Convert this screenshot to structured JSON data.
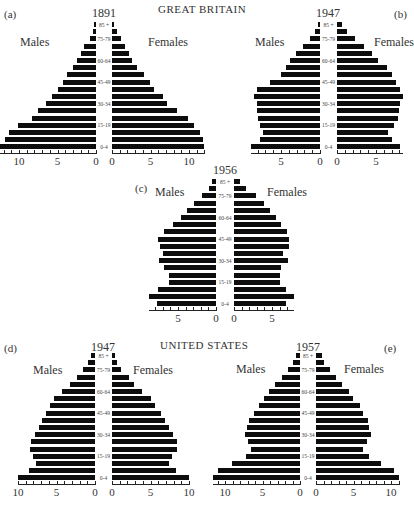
{
  "figure": {
    "titles": {
      "top": "GREAT BRITAIN",
      "bottom": "UNITED STATES"
    },
    "sex_labels": {
      "male": "Males",
      "female": "Females"
    },
    "age_groups": [
      "0-4",
      "5-9",
      "10-14",
      "15-19",
      "20-24",
      "25-29",
      "30-34",
      "35-39",
      "40-44",
      "45-49",
      "50-54",
      "55-59",
      "60-64",
      "65-69",
      "70-74",
      "75-79",
      "80-84",
      "85+"
    ],
    "labeled_ages": [
      "0-4",
      "15-19",
      "30-34",
      "45-49",
      "60-64",
      "75-79",
      "85 +"
    ]
  },
  "chart_data": [
    {
      "type": "bar",
      "subtype": "population-pyramid",
      "panel": "(a)",
      "region": "GREAT BRITAIN",
      "title": "1891",
      "categories": [
        "0-4",
        "5-9",
        "10-14",
        "15-19",
        "20-24",
        "25-29",
        "30-34",
        "35-39",
        "40-44",
        "45-49",
        "50-54",
        "55-59",
        "60-64",
        "65-69",
        "70-74",
        "75-79",
        "80-84",
        "85+"
      ],
      "series": [
        {
          "name": "Males",
          "values": [
            12.5,
            11.8,
            11.3,
            10.1,
            8.3,
            7.5,
            6.5,
            5.7,
            5.0,
            4.3,
            3.8,
            3.0,
            2.5,
            2.0,
            1.5,
            0.8,
            0.4,
            0.3
          ]
        },
        {
          "name": "Females",
          "values": [
            12.0,
            11.8,
            11.4,
            10.6,
            9.9,
            8.5,
            7.1,
            6.6,
            5.5,
            4.9,
            4.2,
            3.3,
            2.6,
            2.2,
            1.7,
            1.2,
            0.6,
            0.3
          ]
        }
      ],
      "xlabel": "",
      "ylabel": "",
      "x_ticks_male": [
        "10",
        "5",
        "0"
      ],
      "x_ticks_female": [
        "0",
        "5",
        "10"
      ],
      "xlim": [
        0,
        12.5
      ]
    },
    {
      "type": "bar",
      "subtype": "population-pyramid",
      "panel": "(b)",
      "region": "GREAT BRITAIN",
      "title": "1947",
      "categories": [
        "0-4",
        "5-9",
        "10-14",
        "15-19",
        "20-24",
        "25-29",
        "30-34",
        "35-39",
        "40-44",
        "45-49",
        "50-54",
        "55-59",
        "60-64",
        "65-69",
        "70-74",
        "75-79",
        "80-84",
        "85+"
      ],
      "series": [
        {
          "name": "Males",
          "values": [
            8.9,
            7.7,
            7.3,
            7.7,
            7.9,
            8.1,
            8.1,
            8.4,
            8.1,
            6.4,
            5.0,
            4.4,
            3.8,
            3.1,
            2.2,
            1.3,
            0.6,
            0.3
          ]
        },
        {
          "name": "Females",
          "values": [
            8.1,
            7.1,
            6.5,
            7.3,
            7.8,
            8.0,
            8.1,
            8.4,
            8.1,
            7.5,
            7.0,
            6.4,
            5.3,
            4.5,
            3.5,
            2.3,
            1.3,
            0.6
          ]
        }
      ],
      "xlabel": "",
      "ylabel": "",
      "x_ticks_male": [
        "5",
        "0"
      ],
      "x_ticks_female": [
        "0",
        "5"
      ],
      "xlim": [
        0,
        9
      ]
    },
    {
      "type": "bar",
      "subtype": "population-pyramid",
      "panel": "(c)",
      "region": "GREAT BRITAIN",
      "title": "1956",
      "categories": [
        "0-4",
        "5-9",
        "10-14",
        "15-19",
        "20-24",
        "25-29",
        "30-34",
        "35-39",
        "40-44",
        "45-49",
        "50-54",
        "55-59",
        "60-64",
        "65-69",
        "70-74",
        "75-79",
        "80-84",
        "85+"
      ],
      "series": [
        {
          "name": "Males",
          "values": [
            7.8,
            8.8,
            7.6,
            6.2,
            6.2,
            6.8,
            7.5,
            7.0,
            7.4,
            7.6,
            6.9,
            5.6,
            4.6,
            3.8,
            2.9,
            1.8,
            0.9,
            0.5
          ]
        },
        {
          "name": "Females",
          "values": [
            6.9,
            7.9,
            6.9,
            6.0,
            6.0,
            6.2,
            7.1,
            6.4,
            7.2,
            7.3,
            7.0,
            6.2,
            5.5,
            4.7,
            3.9,
            2.9,
            1.6,
            0.8
          ]
        }
      ],
      "xlabel": "",
      "ylabel": "",
      "x_ticks_male": [
        "5",
        "0"
      ],
      "x_ticks_female": [
        "0",
        "5"
      ],
      "xlim": [
        0,
        9
      ]
    },
    {
      "type": "bar",
      "subtype": "population-pyramid",
      "panel": "(d)",
      "region": "UNITED STATES",
      "title": "1947",
      "categories": [
        "0-4",
        "5-9",
        "10-14",
        "15-19",
        "20-24",
        "25-29",
        "30-34",
        "35-39",
        "40-44",
        "45-49",
        "50-54",
        "55-59",
        "60-64",
        "65-69",
        "70-74",
        "75-79",
        "80-84",
        "85+"
      ],
      "series": [
        {
          "name": "Males",
          "values": [
            10.0,
            8.6,
            7.6,
            8.1,
            8.5,
            8.3,
            7.8,
            7.3,
            6.9,
            6.4,
            5.9,
            5.3,
            4.3,
            3.3,
            2.4,
            1.6,
            0.9,
            0.5
          ]
        },
        {
          "name": "Females",
          "values": [
            10.0,
            8.3,
            7.4,
            7.8,
            8.5,
            8.5,
            7.9,
            7.4,
            6.9,
            6.3,
            5.6,
            5.0,
            3.9,
            2.9,
            2.2,
            1.2,
            0.7,
            0.4
          ]
        }
      ],
      "xlabel": "",
      "ylabel": "",
      "x_ticks_male": [
        "10",
        "5",
        "0"
      ],
      "x_ticks_female": [
        "0",
        "5",
        "10"
      ],
      "xlim": [
        0,
        10
      ]
    },
    {
      "type": "bar",
      "subtype": "population-pyramid",
      "panel": "(e)",
      "region": "UNITED STATES",
      "title": "1957",
      "categories": [
        "0-4",
        "5-9",
        "10-14",
        "15-19",
        "20-24",
        "25-29",
        "30-34",
        "35-39",
        "40-44",
        "45-49",
        "50-54",
        "55-59",
        "60-64",
        "65-69",
        "70-74",
        "75-79",
        "80-84",
        "85+"
      ],
      "series": [
        {
          "name": "Males",
          "values": [
            11.6,
            11.0,
            9.1,
            7.2,
            6.5,
            6.9,
            7.3,
            7.1,
            6.8,
            6.2,
            5.5,
            4.8,
            4.2,
            3.3,
            2.4,
            1.6,
            1.0,
            0.6
          ]
        },
        {
          "name": "Females",
          "values": [
            11.0,
            10.4,
            8.6,
            7.0,
            6.2,
            6.8,
            7.3,
            7.1,
            6.9,
            6.3,
            5.9,
            4.9,
            4.4,
            3.4,
            2.7,
            1.9,
            1.1,
            0.8
          ]
        }
      ],
      "xlabel": "",
      "ylabel": "",
      "x_ticks_male": [
        "10",
        "5",
        "0"
      ],
      "x_ticks_female": [
        "0",
        "5",
        "10"
      ],
      "xlim": [
        0,
        11.6
      ]
    }
  ],
  "layout": {
    "panels": [
      {
        "id": "a",
        "male_zero": 96,
        "female_zero": 112,
        "scale": 7.7,
        "top_y": 22,
        "bar_pitch": 7.2,
        "bar_h": 5,
        "axis_y": 153,
        "label_x": 4,
        "label_y": 8,
        "year_x": 104,
        "year_y": 6,
        "males_x": 20,
        "males_y": 35,
        "females_x": 148,
        "females_y": 35,
        "ticks_male": [
          10,
          5,
          0
        ],
        "ticks_female": [
          0,
          5,
          10
        ]
      },
      {
        "id": "b",
        "male_zero": 320,
        "female_zero": 337,
        "scale": 7.8,
        "top_y": 22,
        "bar_pitch": 7.2,
        "bar_h": 5,
        "axis_y": 153,
        "label_x": 394,
        "label_y": 8,
        "year_x": 328,
        "year_y": 6,
        "males_x": 255,
        "males_y": 35,
        "females_x": 374,
        "females_y": 35,
        "ticks_male": [
          5,
          0
        ],
        "ticks_female": [
          0,
          5
        ]
      },
      {
        "id": "c",
        "male_zero": 216,
        "female_zero": 234,
        "scale": 7.6,
        "top_y": 179,
        "bar_pitch": 7.2,
        "bar_h": 5,
        "axis_y": 310,
        "label_x": 135,
        "label_y": 182,
        "year_x": 225,
        "year_y": 163,
        "males_x": 155,
        "males_y": 185,
        "females_x": 267,
        "females_y": 185,
        "ticks_male": [
          5,
          0
        ],
        "ticks_female": [
          0,
          5
        ]
      },
      {
        "id": "d",
        "male_zero": 95,
        "female_zero": 112,
        "scale": 7.7,
        "top_y": 353,
        "bar_pitch": 7.2,
        "bar_h": 5,
        "axis_y": 484,
        "label_x": 4,
        "label_y": 342,
        "year_x": 103,
        "year_y": 340,
        "males_x": 33,
        "males_y": 363,
        "females_x": 133,
        "females_y": 363,
        "ticks_male": [
          10,
          5,
          0
        ],
        "ticks_female": [
          0,
          5,
          10
        ]
      },
      {
        "id": "e",
        "male_zero": 300,
        "female_zero": 316,
        "scale": 7.5,
        "top_y": 353,
        "bar_pitch": 7.2,
        "bar_h": 5,
        "axis_y": 484,
        "label_x": 384,
        "label_y": 342,
        "year_x": 308,
        "year_y": 340,
        "males_x": 236,
        "males_y": 362,
        "females_x": 344,
        "females_y": 362,
        "ticks_male": [
          10,
          5,
          0
        ],
        "ticks_female": [
          0,
          5,
          10
        ]
      }
    ]
  },
  "caption": "……(partial caption text cut off at bottom edge)"
}
